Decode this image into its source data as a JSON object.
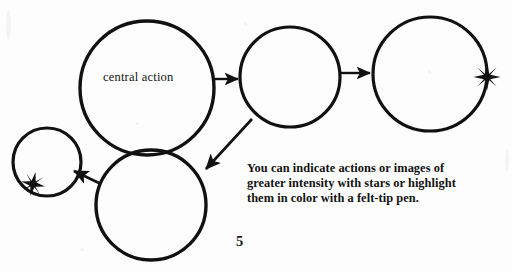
{
  "page": {
    "page_number": "5",
    "background_color": "#fdfdfd",
    "ink_color": "#111111"
  },
  "diagram": {
    "type": "bubble-map",
    "stroke_color": "#111111",
    "nodes": [
      {
        "id": "central-action",
        "label": "central action",
        "cx": 147,
        "cy": 88,
        "r": 67,
        "stroke_width": 3.4,
        "star": null
      },
      {
        "id": "node-top-middle",
        "label": "",
        "cx": 290,
        "cy": 77,
        "r": 50,
        "stroke_width": 3.2,
        "star": null
      },
      {
        "id": "node-top-right",
        "label": "",
        "cx": 430,
        "cy": 74,
        "r": 57,
        "stroke_width": 3.2,
        "star": {
          "cx": 487,
          "cy": 77,
          "points": 8,
          "outer_r": 13,
          "inner_r": 3.4
        }
      },
      {
        "id": "node-bottom-center",
        "label": "",
        "cx": 151,
        "cy": 205,
        "r": 55,
        "stroke_width": 3.4,
        "star": null
      },
      {
        "id": "node-bottom-left",
        "label": "",
        "cx": 47,
        "cy": 162,
        "r": 34,
        "stroke_width": 3.2,
        "star": {
          "cx": 33,
          "cy": 184,
          "points": 8,
          "outer_r": 12,
          "inner_r": 3.2
        }
      }
    ],
    "arrows": [
      {
        "id": "arrow-central-to-middle",
        "from": "central-action",
        "to": "node-top-middle",
        "x1": 215,
        "y1": 79,
        "x2": 238,
        "y2": 79,
        "stroke_width": 2.4
      },
      {
        "id": "arrow-middle-to-right",
        "from": "node-top-middle",
        "to": "node-top-right",
        "x1": 341,
        "y1": 73,
        "x2": 370,
        "y2": 73,
        "stroke_width": 2.4
      },
      {
        "id": "arrow-middle-to-bottom-center",
        "from": "node-top-middle",
        "to": "node-bottom-center",
        "x1": 252,
        "y1": 119,
        "x2": 204,
        "y2": 170,
        "stroke_width": 2.6
      },
      {
        "id": "arrow-bottom-center-to-bottom-left",
        "from": "node-bottom-center",
        "to": "node-bottom-left",
        "x1": 100,
        "y1": 183,
        "x2": 73,
        "y2": 171,
        "stroke_width": 2.6
      }
    ]
  },
  "caption": {
    "lines": [
      "You can indicate actions or images of",
      "greater intensity with stars or highlight",
      "them in color with a felt-tip pen."
    ]
  }
}
